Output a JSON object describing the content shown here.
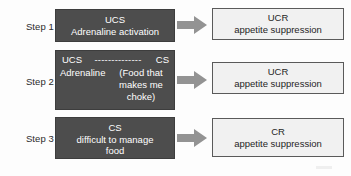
{
  "diagram": {
    "type": "classical-conditioning-flow",
    "colors": {
      "stimulus_box_fill": "#4d4d4d",
      "stimulus_box_text": "#ffffff",
      "response_box_fill": "#f1f1f1",
      "response_box_border": "#5a5a5a",
      "response_box_text": "#1f1f1f",
      "arrow": "#939393",
      "background": "#fdfdfd"
    },
    "steps": [
      {
        "label": "Step 1",
        "stimulus": {
          "title": "UCS",
          "description": "Adrenaline activation"
        },
        "arrow": "right-block-arrow",
        "response": {
          "title": "UCR",
          "description": "appetite suppression"
        }
      },
      {
        "label": "Step 2",
        "pairing": {
          "left_term": "UCS",
          "connector": "--------------",
          "right_term": "CS",
          "left_name": "Adrenaline",
          "right_description": [
            "(Food that",
            "makes me",
            "choke)"
          ]
        },
        "arrow": "right-block-arrow",
        "response": {
          "title": "UCR",
          "description": "appetite suppression"
        }
      },
      {
        "label": "Step 3",
        "stimulus": {
          "title": "CS",
          "description_lines": [
            "difficult to manage",
            "food"
          ]
        },
        "arrow": "right-block-arrow",
        "response": {
          "title": "CR",
          "description": "appetite suppression"
        }
      }
    ]
  }
}
